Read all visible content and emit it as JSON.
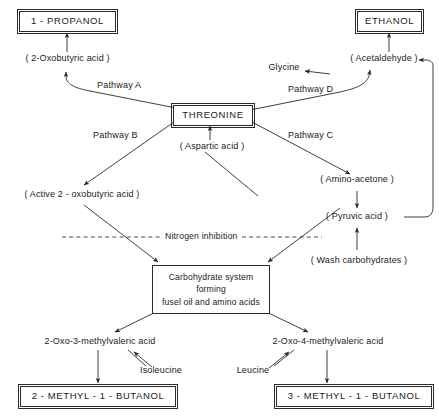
{
  "figure": {
    "type": "flow-diagram",
    "line_color": "#2a2a2a",
    "text_color": "#1a1a1a",
    "background": "#ffffff"
  },
  "nodes": {
    "propanol": {
      "label": "1 - PROPANOL",
      "style": "boxed"
    },
    "ethanol": {
      "label": "ETHANOL",
      "style": "boxed"
    },
    "oxobutyric": {
      "label": "( 2-Oxobutyric  acid )",
      "style": "plain"
    },
    "acetaldehyde": {
      "label": "( Acetaldehyde )",
      "style": "plain"
    },
    "glycine": {
      "label": "Glycine",
      "style": "plain"
    },
    "threonine": {
      "label": "THREONINE",
      "style": "boxed"
    },
    "aspartic": {
      "label": "( Aspartic acid )",
      "style": "plain"
    },
    "active_oxobutyric": {
      "label": "( Active 2 - oxobutyric acid )",
      "style": "plain"
    },
    "amino_acetone": {
      "label": "( Amino-acetone )",
      "style": "plain"
    },
    "pyruvic": {
      "label": "( Pyruvic acid )",
      "style": "plain"
    },
    "wash_carbs": {
      "label": "( Wash  carbohydrates )",
      "style": "plain"
    },
    "carb_system": {
      "line1": "Carbohydrate system",
      "line2": "forming",
      "line3": "fusel oil and amino acids",
      "style": "boxed-multiline"
    },
    "oxo3": {
      "label": "2-Oxo-3-methylvaleric acid",
      "style": "plain"
    },
    "oxo4": {
      "label": "2-Oxo-4-methylvaleric acid",
      "style": "plain"
    },
    "isoleucine": {
      "label": "Isoleucine",
      "style": "plain"
    },
    "leucine": {
      "label": "Leucine",
      "style": "plain"
    },
    "methylbutanol2": {
      "label": "2 - METHYL - 1 - BUTANOL",
      "style": "boxed"
    },
    "methylbutanol3": {
      "label": "3 - METHYL - 1 - BUTANOL",
      "style": "boxed"
    }
  },
  "pathways": {
    "a": "Pathway A",
    "b": "Pathway B",
    "c": "Pathway C",
    "d": "Pathway D",
    "inhibition": "Nitrogen inhibition"
  }
}
